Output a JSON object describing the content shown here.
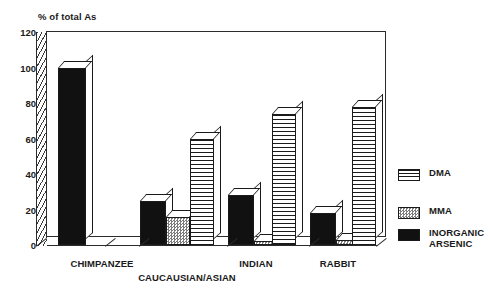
{
  "chart_data": {
    "type": "bar",
    "title": "% of total As",
    "xlabel": "",
    "ylabel": "% of total As",
    "ylim": [
      0,
      120
    ],
    "yticks": [
      0,
      20,
      40,
      60,
      80,
      100,
      120
    ],
    "grid": false,
    "legend_position": "right",
    "style": "3d-grouped-bar",
    "categories": [
      "CHIMPANZEE",
      "CAUCAUSIAN/ASIAN",
      "INDIAN",
      "RABBIT"
    ],
    "series": [
      {
        "name": "INORGANIC\nARSENIC",
        "legend_label": "INORGANIC ARSENIC",
        "pattern": "solid-black",
        "color": "#111111",
        "values": [
          100,
          25,
          28,
          18
        ]
      },
      {
        "name": "MMA",
        "legend_label": "MMA",
        "pattern": "checkered-gray",
        "color": "#7d7d7d",
        "values": [
          0,
          16,
          2,
          3
        ]
      },
      {
        "name": "DMA",
        "legend_label": "DMA",
        "pattern": "horizontal-stripes",
        "color": "#1a1a1a",
        "values": [
          0,
          60,
          74,
          78
        ]
      }
    ]
  },
  "axis": {
    "title": "% of total As",
    "tick_labels": [
      "0",
      "20",
      "40",
      "60",
      "80",
      "100",
      "120"
    ]
  },
  "xaxis": {
    "labels": [
      {
        "text": "CHIMPANZEE",
        "x": 102,
        "y": 258
      },
      {
        "text": "CAUCAUSIAN/ASIAN",
        "x": 187,
        "y": 272
      },
      {
        "text": "INDIAN",
        "x": 256,
        "y": 258
      },
      {
        "text": "RABBIT",
        "x": 338,
        "y": 258
      }
    ]
  },
  "legend": {
    "items": [
      {
        "label": "DMA",
        "pattern": "horizontal-stripes"
      },
      {
        "label": "MMA",
        "pattern": "checkered-gray"
      },
      {
        "label": "INORGANIC\nARSENIC",
        "pattern": "solid-black"
      }
    ]
  },
  "bars": [
    {
      "group": "CHIMPANZEE",
      "series": "INORGANIC ARSENIC",
      "value": 100,
      "fill": "fill-inorganic",
      "x": 58,
      "w": 28
    },
    {
      "group": "CAUCAUSIAN/ASIAN",
      "series": "INORGANIC ARSENIC",
      "value": 25,
      "fill": "fill-inorganic",
      "x": 140,
      "w": 26
    },
    {
      "group": "CAUCAUSIAN/ASIAN",
      "series": "MMA",
      "value": 16,
      "fill": "fill-mma",
      "x": 166,
      "w": 24
    },
    {
      "group": "CAUCAUSIAN/ASIAN",
      "series": "DMA",
      "value": 60,
      "fill": "fill-dma",
      "x": 190,
      "w": 24
    },
    {
      "group": "INDIAN",
      "series": "INORGANIC ARSENIC",
      "value": 28,
      "fill": "fill-inorganic",
      "x": 228,
      "w": 26
    },
    {
      "group": "INDIAN",
      "series": "MMA",
      "value": 2,
      "fill": "fill-mma",
      "x": 254,
      "w": 24
    },
    {
      "group": "INDIAN",
      "series": "DMA",
      "value": 74,
      "fill": "fill-dma",
      "x": 272,
      "w": 24
    },
    {
      "group": "RABBIT",
      "series": "INORGANIC ARSENIC",
      "value": 18,
      "fill": "fill-inorganic",
      "x": 310,
      "w": 26
    },
    {
      "group": "RABBIT",
      "series": "MMA",
      "value": 3,
      "fill": "fill-mma",
      "x": 336,
      "w": 24
    },
    {
      "group": "RABBIT",
      "series": "DMA",
      "value": 78,
      "fill": "fill-dma",
      "x": 352,
      "w": 24
    }
  ]
}
